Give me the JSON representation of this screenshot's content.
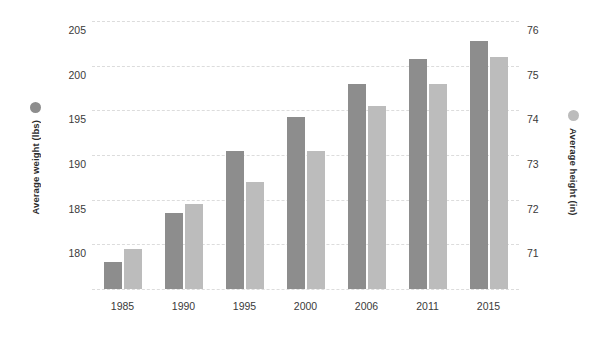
{
  "chart_data": {
    "type": "bar",
    "title": "",
    "subtitle": "",
    "xlabel": "",
    "categories": [
      "1985",
      "1990",
      "1995",
      "2000",
      "2006",
      "2011",
      "2015"
    ],
    "series": [
      {
        "name": "Average weight (lbs)",
        "axis": "left",
        "color": "#8d8d8d",
        "values": [
          178.0,
          183.5,
          190.5,
          194.3,
          198.0,
          200.7,
          202.8
        ]
      },
      {
        "name": "Average height (in)",
        "axis": "right",
        "color": "#bcbcbc",
        "values": [
          70.9,
          71.9,
          72.4,
          73.1,
          74.1,
          74.6,
          75.2
        ]
      }
    ],
    "left_axis": {
      "label": "Average weight (lbs)",
      "ticks": [
        "205",
        "200",
        "195",
        "190",
        "185",
        "180"
      ],
      "tick_values": [
        205,
        200,
        195,
        190,
        185,
        180
      ],
      "ylim": [
        175,
        205
      ],
      "marker_color": "#8d8d8d"
    },
    "right_axis": {
      "label": "Average height (in)",
      "ticks": [
        "76",
        "75",
        "74",
        "73",
        "72",
        "71"
      ],
      "tick_values": [
        76,
        75,
        74,
        73,
        72,
        71
      ],
      "ylim": [
        70,
        76
      ],
      "marker_color": "#bcbcbc"
    },
    "grid": {
      "enabled": true,
      "style": "dashed",
      "color": "#dcdcdc",
      "count": 7
    },
    "legend": {
      "position": "axis-titles",
      "entries": [
        {
          "label": "Average weight (lbs)",
          "color": "#8d8d8d"
        },
        {
          "label": "Average height (in)",
          "color": "#bcbcbc"
        }
      ]
    },
    "background_color": "#ffffff"
  }
}
